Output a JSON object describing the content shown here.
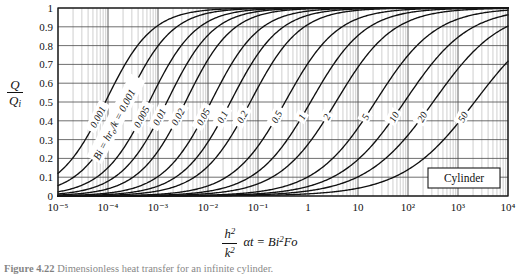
{
  "figure": {
    "caption_prefix": "Figure 4.22",
    "caption_text": "Dimensionless heat transfer for an infinite cylinder.",
    "body_label": "Cylinder"
  },
  "axes": {
    "y_label_num": "Q",
    "y_label_den": "Q",
    "y_label_den_sub": "i",
    "x_label_num": "h",
    "x_label_num_sup": "2",
    "x_label_den": "k",
    "x_label_den_sup": "2",
    "x_label_rest": "αt = Bi",
    "x_label_rest_sup": "2",
    "x_label_tail": "Fo",
    "curve_family_label_prefix": "Bi = ",
    "curve_family_label_num": "hr",
    "curve_family_label_num_sub": "o",
    "curve_family_label_den": "k",
    "curve_family_label_suffix": " = 0.001"
  },
  "chart_data": {
    "type": "line",
    "title": "",
    "xlabel": "h^2/k^2 · αt = Bi^2 Fo",
    "ylabel": "Q/Q_i",
    "xscale": "log",
    "xlim": [
      1e-05,
      10000.0
    ],
    "ylim": [
      0,
      1
    ],
    "grid": true,
    "legend": "inline-curve-labels",
    "x_tick_labels": [
      "10⁻⁵",
      "10⁻⁴",
      "10⁻³",
      "10⁻²",
      "10⁻¹",
      "1",
      "10",
      "10²",
      "10³",
      "10⁴"
    ],
    "x_tick_values": [
      1e-05,
      0.0001,
      0.001,
      0.01,
      0.1,
      1,
      10,
      100,
      1000,
      10000
    ],
    "y_tick_labels": [
      "0",
      "0.1",
      "0.2",
      "0.3",
      "0.4",
      "0.5",
      "0.6",
      "0.7",
      "0.8",
      "0.9",
      "1"
    ],
    "y_tick_values": [
      0,
      0.1,
      0.2,
      0.3,
      0.4,
      0.5,
      0.6,
      0.7,
      0.8,
      0.9,
      1
    ],
    "series": [
      {
        "name": "0.001",
        "bi": 0.001,
        "x50": 0.0001,
        "width": 1.05
      },
      {
        "name": "0.002",
        "bi": 0.002,
        "x50": 0.00026,
        "width": 1.05
      },
      {
        "name": "0.005",
        "bi": 0.005,
        "x50": 0.00075,
        "width": 1.05
      },
      {
        "name": "0.01",
        "bi": 0.01,
        "x50": 0.0017,
        "width": 1.05
      },
      {
        "name": "0.02",
        "bi": 0.02,
        "x50": 0.004,
        "width": 1.05
      },
      {
        "name": "0.05",
        "bi": 0.05,
        "x50": 0.013,
        "width": 1.08
      },
      {
        "name": "0.1",
        "bi": 0.1,
        "x50": 0.032,
        "width": 1.1
      },
      {
        "name": "0.2",
        "bi": 0.2,
        "x50": 0.08,
        "width": 1.12
      },
      {
        "name": "0.5",
        "bi": 0.5,
        "x50": 0.4,
        "width": 1.18
      },
      {
        "name": "1",
        "bi": 1,
        "x50": 1.3,
        "width": 1.22
      },
      {
        "name": "2",
        "bi": 2,
        "x50": 4.2,
        "width": 1.28
      },
      {
        "name": "5",
        "bi": 5,
        "x50": 26.0,
        "width": 1.36
      },
      {
        "name": "10",
        "bi": 10,
        "x50": 100.0,
        "width": 1.44
      },
      {
        "name": "20",
        "bi": 20,
        "x50": 380.0,
        "width": 1.52
      },
      {
        "name": "50",
        "bi": 50,
        "x50": 2600.0,
        "width": 1.62
      }
    ],
    "curve_labels": [
      "0.001",
      "0.002",
      "0.005",
      "0.01",
      "0.02",
      "0.05",
      "0.1",
      "0.2",
      "0.5",
      "1",
      "2",
      "5",
      "10",
      "20",
      "50"
    ]
  },
  "colors": {
    "curve": "#111111",
    "grid_major": "#4a4a4a",
    "grid_minor": "#8c8c8c",
    "frame": "#1a1a1a",
    "background": "#ffffff",
    "text": "#111111"
  }
}
